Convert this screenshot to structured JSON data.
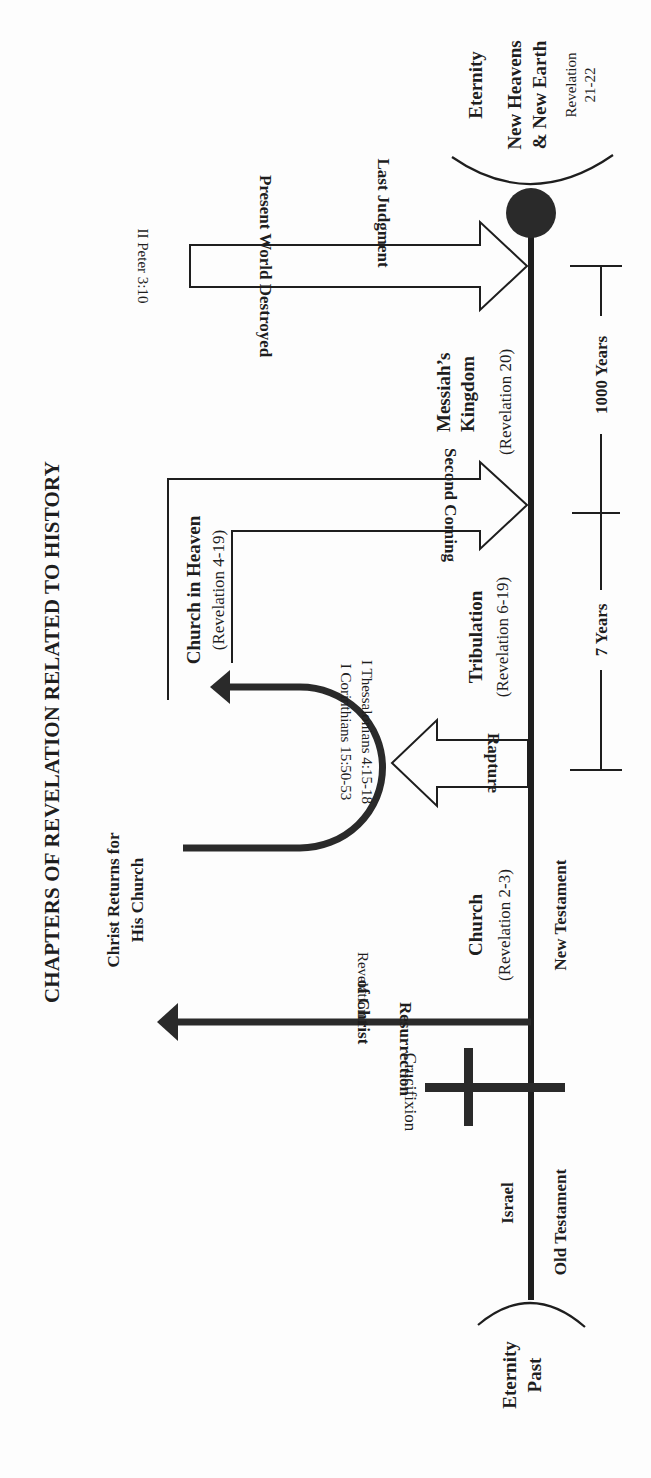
{
  "title": "CHAPTERS OF REVELATION RELATED TO HISTORY",
  "eras": {
    "eternity_past": [
      "Eternity",
      "Past"
    ],
    "eternity": "Eternity",
    "old_testament": "Old Testament",
    "new_testament": "New Testament"
  },
  "periods": {
    "israel": "Israel",
    "church": "Church",
    "church_ref": "(Revelation 2-3)",
    "tribulation": "Tribulation",
    "tribulation_ref": "(Revelation 6-19)",
    "church_in_heaven": "Church in Heaven",
    "church_in_heaven_ref": "(Revelation 4-19)",
    "messiahs_kingdom": [
      "Messiah’s",
      "Kingdom"
    ],
    "messiahs_kingdom_ref": "(Revelation 20)",
    "new_heavens": [
      "New Heavens",
      "& New Earth"
    ],
    "new_heavens_ref": [
      "Revelation",
      "21-22"
    ]
  },
  "events": {
    "crucifixion": "Crucifixion",
    "resurrection": [
      "Resurrection",
      "of Christ"
    ],
    "resurrection_ref": "Revelation 1",
    "christ_returns": [
      "Christ Returns for",
      "His Church"
    ],
    "rapture": "Rapture",
    "rapture_refs": [
      "I Thessalonians 4:15-18",
      "I Corinthians 15:50-53"
    ],
    "second_coming": "Second Coming",
    "present_world_destroyed": "Present World Destroyed",
    "present_world_ref": "II Peter 3:10",
    "last_judgment": "Last Judgment"
  },
  "durations": {
    "tribulation": "7 Years",
    "kingdom": "1000 Years"
  }
}
